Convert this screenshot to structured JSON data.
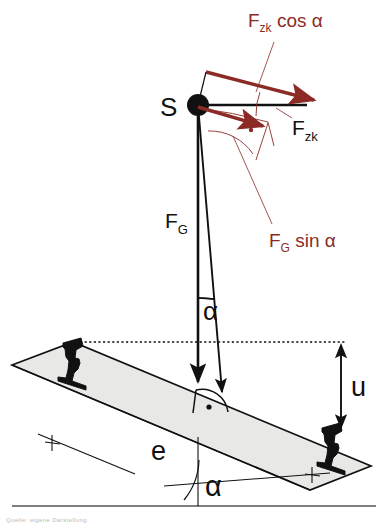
{
  "diagram": {
    "colors": {
      "red": "#8c2b26",
      "black": "#111111",
      "plate_fill": "#e8e8e6",
      "plate_stroke": "#111111",
      "ground": "#555555",
      "caption_gray": "#b9b9b9"
    },
    "labels": {
      "centroid": "S",
      "fzk_cos_alpha_base": "F",
      "fzk_cos_alpha_sub": "zk",
      "fzk_cos_alpha_rest": " cos α",
      "fzk_base": "F",
      "fzk_sub": "zk",
      "fg_base": "F",
      "fg_sub": "G",
      "fg_sin_alpha_base": "F",
      "fg_sin_alpha_sub": "G",
      "fg_sin_alpha_rest": " sin α",
      "alpha_upper": "α",
      "alpha_lower": "α",
      "superelevation": "u",
      "gauge": "e"
    },
    "annotations": {
      "right_angle_marker": "perpendicular-to-track",
      "angle_upper_name": "alpha-between-vertical-and-resultant",
      "angle_lower_name": "track-cant-angle-alpha",
      "dimension_u_name": "cant-height-u",
      "dimension_e_name": "track-gauge-e"
    },
    "caption": "Quelle: eigene Darstellung"
  }
}
